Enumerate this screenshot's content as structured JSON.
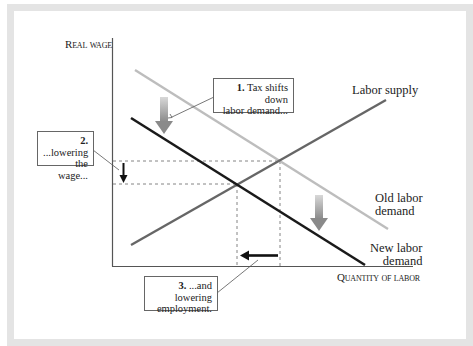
{
  "diagram": {
    "axes": {
      "y_label": "Real wage",
      "x_label": "Quantity of labor"
    },
    "curves": {
      "supply": {
        "label": "Labor supply",
        "color": "#666666"
      },
      "old_demand": {
        "label_line1": "Old labor",
        "label_line2": "demand",
        "color": "#bdbdbd"
      },
      "new_demand": {
        "label_line1": "New labor",
        "label_line2": "demand",
        "color": "#1a1a1a"
      }
    },
    "callouts": [
      {
        "number": "1.",
        "line1": "Tax shifts down",
        "line2": "labor demand..."
      },
      {
        "number": "2.",
        "line1": "...lowering",
        "line2": "the wage..."
      },
      {
        "number": "3.",
        "line1": "...and lowering",
        "line2": "employment."
      }
    ],
    "colors": {
      "frame": "#e4e4e4",
      "background": "#ffffff",
      "axis": "#555555",
      "dashed": "#666666",
      "arrow": "#111111"
    }
  }
}
